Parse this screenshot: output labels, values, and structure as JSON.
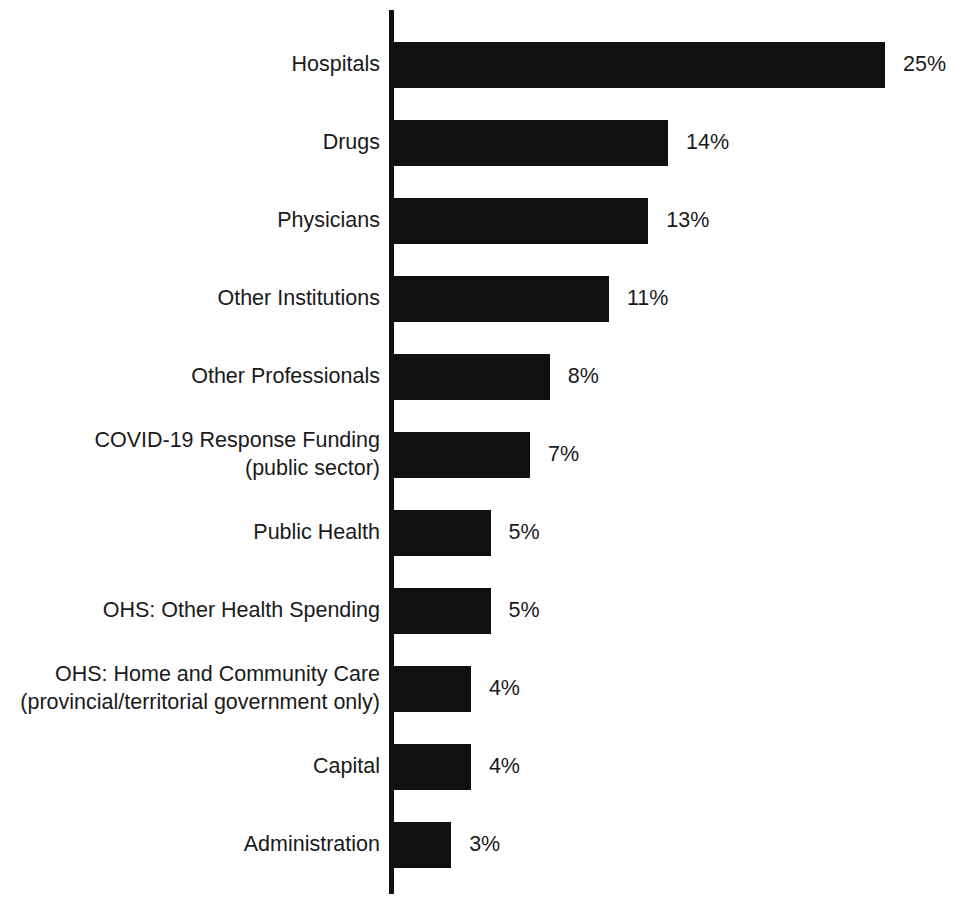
{
  "chart_data": {
    "type": "bar",
    "orientation": "horizontal",
    "title": "",
    "subtitle": "",
    "xlabel": "",
    "ylabel": "",
    "grid": false,
    "legend": null,
    "axis_visible": {
      "category_axis": true,
      "value_axis": false
    },
    "value_suffix": "%",
    "xlim": [
      0,
      25
    ],
    "categories": [
      "Hospitals",
      "Drugs",
      "Physicians",
      "Other Institutions",
      "Other Professionals",
      "COVID-19 Response Funding\n(public sector)",
      "Public Health",
      "OHS: Other Health Spending",
      "OHS: Home and Community Care\n(provincial/territorial government only)",
      "Capital",
      "Administration"
    ],
    "values": [
      25,
      14,
      13,
      11,
      8,
      7,
      5,
      5,
      4,
      4,
      3
    ],
    "data_labels": [
      "25%",
      "14%",
      "13%",
      "11%",
      "8%",
      "7%",
      "5%",
      "5%",
      "4%",
      "4%",
      "3%"
    ],
    "colors": {
      "bar": "#111111",
      "axis": "#111111",
      "text": "#1a1a1a",
      "background": "#ffffff"
    }
  },
  "layout": {
    "bar_origin_x": 392,
    "bar_height": 46,
    "row_pitch": 78,
    "first_row_top": 42,
    "px_per_unit": 19.72,
    "value_label_gap": 18
  }
}
